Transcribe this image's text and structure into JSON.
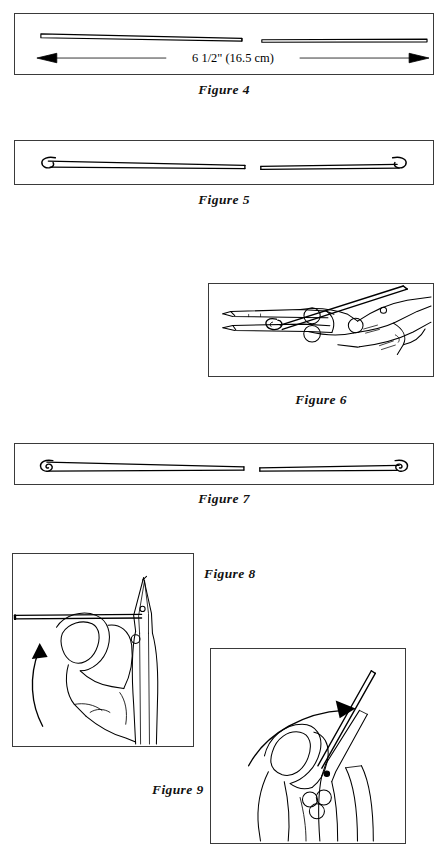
{
  "page": {
    "background_color": "#ffffff",
    "ink_color": "#000000",
    "panel_border_color": "#3a3a3a",
    "width": 447,
    "height": 855
  },
  "figures": [
    {
      "id": "fig4",
      "caption": "Figure 4",
      "caption_position": "below-center",
      "subject": "straight-wire-with-dimension",
      "dimension_label": "6 1/2\" (16.5 cm)",
      "description": "A straight length of wire shown full width with a double-headed dimension arrow beneath it, interrupted at the center to indicate a break in scale.",
      "arrow_style": "double-headed-solid-triangles",
      "wire_ends": "cut-square"
    },
    {
      "id": "fig5",
      "caption": "Figure 5",
      "caption_position": "below-center",
      "subject": "wire-with-open-hooks",
      "description": "The same wire after each end has been started into an open C-shaped hook using round-nose pliers.",
      "wire_ends": "open-hook"
    },
    {
      "id": "fig6",
      "caption": "Figure 6",
      "caption_position": "below-center",
      "subject": "pliers-gripping-wire-end",
      "description": "A hand holding needle-nose pliers whose jaws grip the curled end of the wire to continue rolling the loop closed.",
      "tool": "needle-nose-pliers",
      "hand": "right-hand"
    },
    {
      "id": "fig7",
      "caption": "Figure 7",
      "caption_position": "below-center",
      "subject": "wire-with-closed-loops",
      "description": "The finished wire with a tightly closed spiral loop formed at each end.",
      "wire_ends": "closed-loop"
    },
    {
      "id": "fig8",
      "caption": "Figure 8",
      "caption_position": "right-of-panel",
      "subject": "bending-wire-upward-side-view",
      "description": "Close view of a thumb and fingers holding pliers that clamp a horizontal wire; a curved arrow at the left shows the free end being swung upward.",
      "arrow_direction": "upward-curved",
      "tool": "needle-nose-pliers"
    },
    {
      "id": "fig9",
      "caption": "Figure 9",
      "caption_position": "left-of-panel",
      "subject": "rotating-wire-to-vertical",
      "description": "The same grip after rotation: the wire now points up and to the right while a long curved arrow above indicates the sweeping direction of travel.",
      "arrow_direction": "rightward-curved",
      "tool": "needle-nose-pliers"
    }
  ]
}
